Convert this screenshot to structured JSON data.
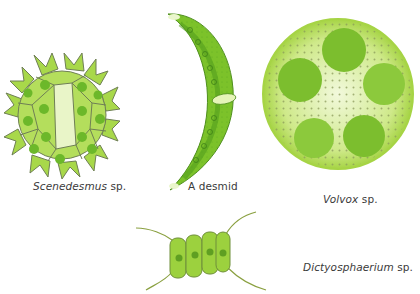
{
  "figure": {
    "colors": {
      "light_green": "#a8d84a",
      "mid_green": "#7cc22a",
      "dark_green": "#5aa620",
      "outline": "#6f7f55",
      "pale": "#e9f5c8",
      "text": "#3a3a3a"
    },
    "organisms": [
      {
        "id": "star-colony",
        "genus": "Scenedesmus",
        "suffix": " sp."
      },
      {
        "id": "crescent-cell",
        "label": "A desmid"
      },
      {
        "id": "sphere-colony",
        "genus": "Volvox",
        "suffix": " sp."
      },
      {
        "id": "four-cell-colony",
        "genus": "Dictyosphaerium",
        "suffix": " sp."
      }
    ]
  }
}
